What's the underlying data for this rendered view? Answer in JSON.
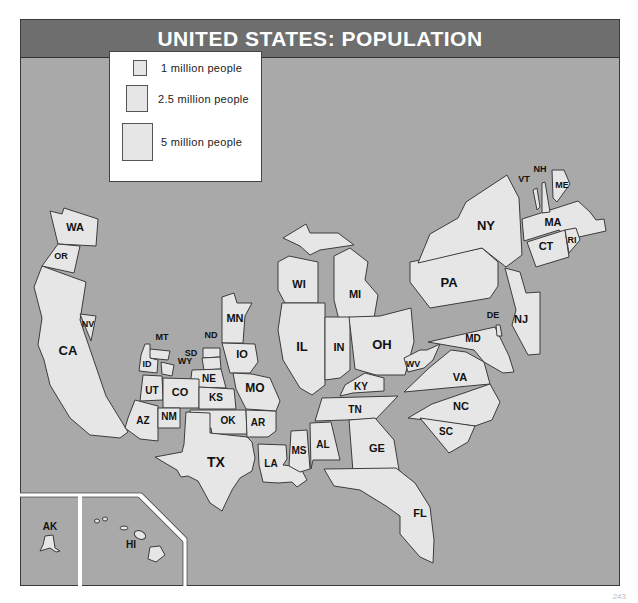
{
  "header": {
    "title": "UNITED STATES: POPULATION"
  },
  "legend": {
    "items": [
      {
        "label": "1 million people",
        "size": 14
      },
      {
        "label": "2.5 million people",
        "size": 22
      },
      {
        "label": "5 million people",
        "size": 31
      }
    ]
  },
  "colors": {
    "background": "#a9a9a9",
    "state_fill": "#e6e6e6",
    "title_bar": "#6e6e6e",
    "border": "#3c3c3c"
  },
  "states": [
    {
      "abbr": "WA",
      "x": 75,
      "y": 231,
      "fs": 11
    },
    {
      "abbr": "OR",
      "x": 61,
      "y": 259,
      "fs": 9
    },
    {
      "abbr": "CA",
      "x": 68,
      "y": 355,
      "fs": 13
    },
    {
      "abbr": "NV",
      "x": 88,
      "y": 327,
      "fs": 9
    },
    {
      "abbr": "MT",
      "x": 162,
      "y": 340,
      "fs": 9
    },
    {
      "abbr": "ID",
      "x": 147,
      "y": 367,
      "fs": 9
    },
    {
      "abbr": "WY",
      "x": 185,
      "y": 364,
      "fs": 9
    },
    {
      "abbr": "ND",
      "x": 211,
      "y": 338,
      "fs": 9
    },
    {
      "abbr": "SD",
      "x": 191,
      "y": 356,
      "fs": 9
    },
    {
      "abbr": "MN",
      "x": 235,
      "y": 322,
      "fs": 11
    },
    {
      "abbr": "IO",
      "x": 242,
      "y": 358,
      "fs": 11
    },
    {
      "abbr": "NE",
      "x": 209,
      "y": 382,
      "fs": 10
    },
    {
      "abbr": "UT",
      "x": 152,
      "y": 394,
      "fs": 10
    },
    {
      "abbr": "CO",
      "x": 180,
      "y": 396,
      "fs": 11
    },
    {
      "abbr": "KS",
      "x": 216,
      "y": 401,
      "fs": 10
    },
    {
      "abbr": "MO",
      "x": 255,
      "y": 392,
      "fs": 12
    },
    {
      "abbr": "AZ",
      "x": 143,
      "y": 424,
      "fs": 10
    },
    {
      "abbr": "NM",
      "x": 169,
      "y": 420,
      "fs": 10
    },
    {
      "abbr": "OK",
      "x": 228,
      "y": 424,
      "fs": 10
    },
    {
      "abbr": "AR",
      "x": 258,
      "y": 426,
      "fs": 10
    },
    {
      "abbr": "TX",
      "x": 216,
      "y": 467,
      "fs": 14
    },
    {
      "abbr": "LA",
      "x": 271,
      "y": 467,
      "fs": 10
    },
    {
      "abbr": "MS",
      "x": 299,
      "y": 454,
      "fs": 10
    },
    {
      "abbr": "AL",
      "x": 323,
      "y": 448,
      "fs": 10
    },
    {
      "abbr": "WI",
      "x": 299,
      "y": 288,
      "fs": 11
    },
    {
      "abbr": "MI",
      "x": 355,
      "y": 298,
      "fs": 11
    },
    {
      "abbr": "IL",
      "x": 302,
      "y": 351,
      "fs": 13
    },
    {
      "abbr": "IN",
      "x": 339,
      "y": 351,
      "fs": 11
    },
    {
      "abbr": "OH",
      "x": 382,
      "y": 349,
      "fs": 13
    },
    {
      "abbr": "KY",
      "x": 361,
      "y": 390,
      "fs": 10
    },
    {
      "abbr": "TN",
      "x": 355,
      "y": 413,
      "fs": 10
    },
    {
      "abbr": "GE",
      "x": 377,
      "y": 452,
      "fs": 11
    },
    {
      "abbr": "FL",
      "x": 420,
      "y": 517,
      "fs": 11
    },
    {
      "abbr": "WV",
      "x": 413,
      "y": 367,
      "fs": 9
    },
    {
      "abbr": "VA",
      "x": 460,
      "y": 381,
      "fs": 11
    },
    {
      "abbr": "NC",
      "x": 461,
      "y": 410,
      "fs": 11
    },
    {
      "abbr": "SC",
      "x": 446,
      "y": 435,
      "fs": 10
    },
    {
      "abbr": "MD",
      "x": 473,
      "y": 342,
      "fs": 10
    },
    {
      "abbr": "DE",
      "x": 493,
      "y": 318,
      "fs": 9
    },
    {
      "abbr": "NJ",
      "x": 521,
      "y": 323,
      "fs": 11
    },
    {
      "abbr": "PA",
      "x": 449,
      "y": 287,
      "fs": 13
    },
    {
      "abbr": "NY",
      "x": 486,
      "y": 230,
      "fs": 13
    },
    {
      "abbr": "CT",
      "x": 546,
      "y": 250,
      "fs": 11
    },
    {
      "abbr": "RI",
      "x": 572,
      "y": 243,
      "fs": 9
    },
    {
      "abbr": "MA",
      "x": 553,
      "y": 226,
      "fs": 11
    },
    {
      "abbr": "VT",
      "x": 524,
      "y": 182,
      "fs": 9
    },
    {
      "abbr": "NH",
      "x": 540,
      "y": 172,
      "fs": 9
    },
    {
      "abbr": "ME",
      "x": 562,
      "y": 188,
      "fs": 9
    },
    {
      "abbr": "AK",
      "x": 50,
      "y": 530,
      "fs": 10
    },
    {
      "abbr": "HI",
      "x": 131,
      "y": 548,
      "fs": 10
    }
  ],
  "footer": {
    "page_mark": "243"
  }
}
